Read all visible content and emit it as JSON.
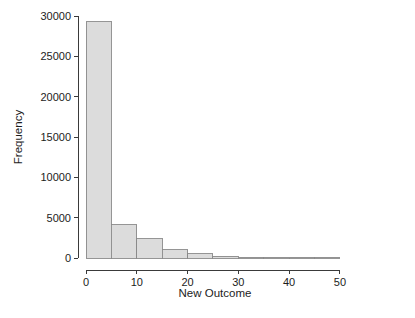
{
  "chart_data": {
    "type": "bar",
    "title": "",
    "subtitle": "",
    "xlabel": "New Outcome",
    "ylabel": "Frequency",
    "xlim": [
      0,
      51
    ],
    "ylim": [
      0,
      30000
    ],
    "grid": false,
    "legend": null,
    "bin_width": 5,
    "x_ticks": [
      0,
      10,
      20,
      30,
      40,
      50
    ],
    "x_tick_labels": [
      "0",
      "10",
      "20",
      "30",
      "40",
      "50"
    ],
    "y_ticks": [
      0,
      5000,
      10000,
      15000,
      20000,
      25000,
      30000
    ],
    "y_tick_labels": [
      "0",
      "5000",
      "10000",
      "15000",
      "20000",
      "25000",
      "30000"
    ],
    "categories": [
      "0-5",
      "5-10",
      "10-15",
      "15-20",
      "20-25",
      "25-30",
      "30-35",
      "35-40",
      "40-45",
      "45-50"
    ],
    "bin_starts": [
      0,
      5,
      10,
      15,
      20,
      25,
      30,
      35,
      40,
      45
    ],
    "bin_ends": [
      5,
      10,
      15,
      20,
      25,
      30,
      35,
      40,
      45,
      50
    ],
    "values": [
      29300,
      4150,
      2400,
      1000,
      500,
      230,
      100,
      30,
      10,
      5
    ],
    "bar_fill": "#dcdcdc",
    "bar_stroke": "#8a8a8a",
    "axis_color": "#3a3a3a",
    "text_color": "#1c1c1c",
    "background": "#ffffff"
  },
  "figure": {
    "plot_left_px": 86,
    "plot_right_px": 345,
    "plot_bottom_px": 258,
    "plot_top_px": 16
  }
}
